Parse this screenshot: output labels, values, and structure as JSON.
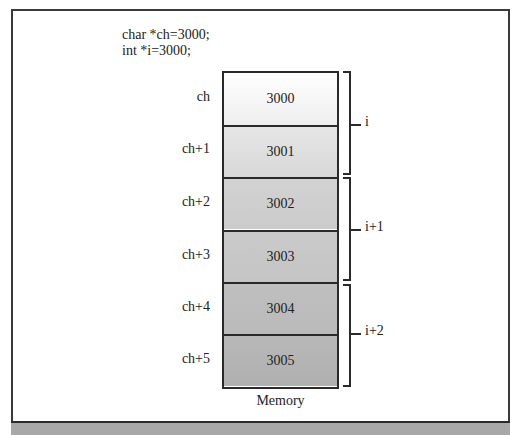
{
  "code": {
    "line1": "char *ch=3000;",
    "line2": "int *i=3000;"
  },
  "memory": {
    "label": "Memory",
    "cells": [
      {
        "address": "3000",
        "pointer": "ch",
        "color": "#f8f8f8"
      },
      {
        "address": "3001",
        "pointer": "ch+1",
        "color": "#e0e0e0"
      },
      {
        "address": "3002",
        "pointer": "ch+2",
        "color": "#cfcfcf"
      },
      {
        "address": "3003",
        "pointer": "ch+3",
        "color": "#c8c8c8"
      },
      {
        "address": "3004",
        "pointer": "ch+4",
        "color": "#bdbdbd"
      },
      {
        "address": "3005",
        "pointer": "ch+5",
        "color": "#b3b3b3"
      }
    ]
  },
  "int_pointers": [
    {
      "label": "i",
      "covers": [
        "3000",
        "3001"
      ]
    },
    {
      "label": "i+1",
      "covers": [
        "3002",
        "3003"
      ]
    },
    {
      "label": "i+2",
      "covers": [
        "3004",
        "3005"
      ]
    }
  ]
}
